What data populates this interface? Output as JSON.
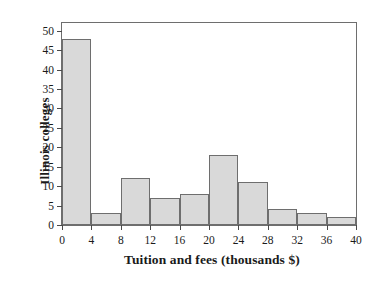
{
  "chart_data": {
    "type": "bar",
    "title": "",
    "subtitle": "",
    "xlabel": "Tuition and fees (thousands $)",
    "ylabel": "Illinois colleges",
    "bin_width": 4,
    "bin_edges": [
      0,
      4,
      8,
      12,
      16,
      20,
      24,
      28,
      32,
      36,
      40
    ],
    "categories": [
      "0-4",
      "4-8",
      "8-12",
      "12-16",
      "16-20",
      "20-24",
      "24-28",
      "28-32",
      "32-36",
      "36-40"
    ],
    "values": [
      48,
      3,
      12,
      7,
      8,
      18,
      11,
      4,
      3,
      2
    ],
    "xlim": [
      0,
      40
    ],
    "ylim": [
      0,
      52
    ],
    "xticks": [
      0,
      4,
      8,
      12,
      16,
      20,
      24,
      28,
      32,
      36,
      40
    ],
    "xtick_labels": [
      "0",
      "4",
      "8",
      "12",
      "16",
      "20",
      "24",
      "28",
      "32",
      "36",
      "40"
    ],
    "yticks": [
      0,
      5,
      10,
      15,
      20,
      25,
      30,
      35,
      40,
      45,
      50
    ],
    "ytick_labels": [
      "0",
      "5",
      "10",
      "15",
      "20",
      "25",
      "30",
      "35",
      "40",
      "45",
      "50"
    ],
    "grid": false,
    "legend": false,
    "legend_position": "none",
    "bar_fill_color": "#d9d9d9",
    "bar_edge_color": "#6e6e6e",
    "frame_color": "#6e6e6e",
    "background_color": "#ffffff",
    "text_color": "#1a1a1a"
  }
}
